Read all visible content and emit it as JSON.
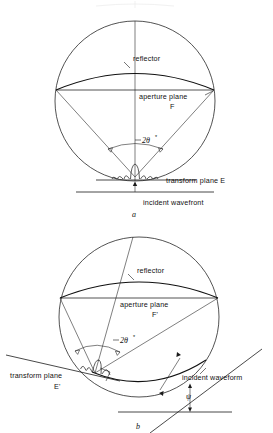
{
  "figure": {
    "kind": "technical-line-diagram",
    "captions": {
      "panel_a": "a",
      "panel_b": "b"
    },
    "panel_a": {
      "name": "normal-incidence-case",
      "labels": {
        "reflector": "reflector",
        "aperture_plane": "aperture plane",
        "aperture_plane_symbol": "F",
        "angle": "2θ",
        "angle_superscript": "*",
        "transform_plane": "transform plane E",
        "incident": "incident  wavefront"
      }
    },
    "panel_b": {
      "name": "oblique-incidence-case",
      "labels": {
        "reflector": "reflector",
        "aperture_plane": "aperture plane",
        "aperture_plane_symbol": "F'",
        "angle": "2θ",
        "angle_superscript": "*",
        "transform_plane": "transform plane",
        "transform_plane_symbol": "E'",
        "incident": "incident waveform",
        "tilt_angle": "ψ"
      }
    },
    "colors": {
      "ink": "#1a1a1a",
      "paper": "#ffffff",
      "reflector_stroke": "#111111"
    }
  }
}
